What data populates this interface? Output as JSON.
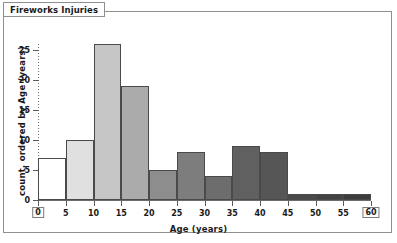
{
  "window": {
    "title": "Fireworks Injuries"
  },
  "axes": {
    "x_title": "Age (years)",
    "y_title": "count, ordered by Age (years)",
    "x_ticks": [
      "0",
      "5",
      "10",
      "15",
      "20",
      "25",
      "30",
      "35",
      "40",
      "45",
      "50",
      "55",
      "60"
    ],
    "y_ticks": [
      "0",
      "5",
      "10",
      "15",
      "20",
      "25"
    ]
  },
  "chart_data": {
    "type": "bar",
    "title": "Fireworks Injuries",
    "xlabel": "Age (years)",
    "ylabel": "count, ordered by Age (years)",
    "xlim": [
      0,
      60
    ],
    "ylim": [
      0,
      26
    ],
    "grid": false,
    "legend": "none",
    "bin_width": 5,
    "categories": [
      "0-5",
      "5-10",
      "10-15",
      "15-20",
      "20-25",
      "25-30",
      "30-35",
      "35-40",
      "40-45",
      "45-50",
      "50-55",
      "55-60"
    ],
    "bin_starts": [
      0,
      5,
      10,
      15,
      20,
      25,
      30,
      35,
      40,
      45,
      50,
      55
    ],
    "values": [
      7,
      10,
      26,
      19,
      5,
      8,
      4,
      9,
      8,
      1,
      1,
      1
    ],
    "bar_colors": [
      "#ffffff",
      "#e0e0e0",
      "#c6c6c6",
      "#ababab",
      "#8d8d8d",
      "#7d7d7d",
      "#6d6d6d",
      "#606060",
      "#565656",
      "#4a4a4a",
      "#434343",
      "#3d3d3d"
    ],
    "bar_edge_color": "#4a4a4a",
    "boxed_tick_labels": [
      "0",
      "60"
    ]
  }
}
